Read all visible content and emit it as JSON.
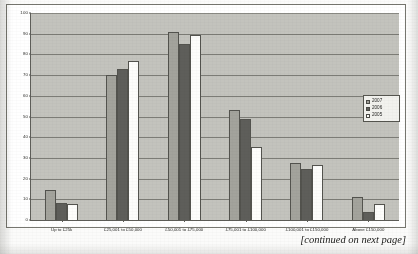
{
  "caption": {
    "text": "[continued on next page]"
  },
  "legend": {
    "position": "right",
    "entries": [
      {
        "label": "2007",
        "color": "#a3a39c"
      },
      {
        "label": "2006",
        "color": "#5e5e5a"
      },
      {
        "label": "2005",
        "color": "#fdfdfb"
      }
    ]
  },
  "axes": {
    "y_ticks": [
      "0",
      "10",
      "20",
      "30",
      "40",
      "50",
      "60",
      "70",
      "80",
      "90",
      "100"
    ]
  },
  "chart_data": {
    "type": "bar",
    "title": "",
    "xlabel": "",
    "ylabel": "",
    "ylim": [
      0,
      100
    ],
    "ytick_step": 10,
    "grid": true,
    "legend_position": "right",
    "plot_background": "#c3c3bd",
    "categories": [
      "Up to £25k",
      "£25,001 to £50,000",
      "£50,001 to £75,000",
      "£75,001 to £100,000",
      "£100,001 to £150,000",
      "Above £150,000"
    ],
    "series": [
      {
        "name": "2007",
        "color": "#a3a39c",
        "values": [
          14.5,
          70,
          91,
          53,
          27.5,
          11
        ]
      },
      {
        "name": "2006",
        "color": "#5e5e5a",
        "values": [
          8,
          73,
          85,
          49,
          24.5,
          4
        ]
      },
      {
        "name": "2005",
        "color": "#fdfdfb",
        "values": [
          7.5,
          77,
          89.5,
          35.5,
          26.5,
          7.5
        ]
      }
    ]
  }
}
